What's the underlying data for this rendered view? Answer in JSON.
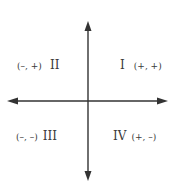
{
  "diagram": {
    "type": "coordinate-plane-quadrants",
    "axis_color": "#333333",
    "text_color": "#3a3a3a",
    "quadrants": [
      {
        "numeral": "I",
        "signs": "(+, +)"
      },
      {
        "numeral": "II",
        "signs": "(–, +)"
      },
      {
        "numeral": "III",
        "signs": "(–, –)"
      },
      {
        "numeral": "IV",
        "signs": "(+, –)"
      }
    ]
  }
}
